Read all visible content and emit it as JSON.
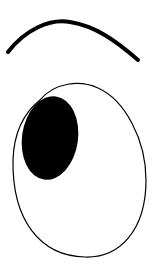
{
  "drawing": {
    "subject": "eye with eyebrow",
    "background": "#ffffff",
    "stroke_color": "#000000",
    "pupil_color": "#000000",
    "eyebrow": {
      "path": "M 8 52 C 25 30, 50 18, 70 22 C 95 26, 115 40, 138 60",
      "stroke_width": 4
    },
    "eye_outline": {
      "path": "M 40 100 C 55 82, 80 80, 98 88 C 125 100, 146 140, 146 180 C 146 230, 120 258, 85 257 C 40 256, 12 220, 13 160 C 14 130, 25 112, 40 100 Z",
      "stroke_width": 1.2
    },
    "pupil": {
      "cx": 50,
      "cy": 138,
      "rx": 28,
      "ry": 42,
      "rotate": 8
    }
  }
}
